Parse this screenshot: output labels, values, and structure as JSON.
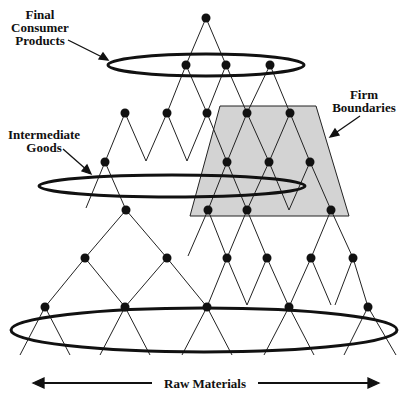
{
  "labels": {
    "final_l1": "Final",
    "final_l2": "Consumer",
    "final_l3": "Products",
    "firm_l1": "Firm",
    "firm_l2": "Boundaries",
    "inter_l1": "Intermediate",
    "inter_l2": "Goods",
    "raw": "Raw Materials"
  },
  "colors": {
    "node": "#111111",
    "line": "#222222",
    "firm_fill": "#d3d3d3"
  },
  "nodes": [
    [
      206,
      18
    ],
    [
      186,
      65
    ],
    [
      226,
      65
    ],
    [
      270,
      65
    ],
    [
      125,
      113
    ],
    [
      167,
      113
    ],
    [
      207,
      113
    ],
    [
      247,
      113
    ],
    [
      290,
      113
    ],
    [
      105,
      162
    ],
    [
      227,
      162
    ],
    [
      269,
      162
    ],
    [
      310,
      162
    ],
    [
      126,
      210
    ],
    [
      208,
      210
    ],
    [
      247,
      210
    ],
    [
      331,
      210
    ],
    [
      85,
      258
    ],
    [
      167,
      258
    ],
    [
      227,
      258
    ],
    [
      267,
      258
    ],
    [
      311,
      258
    ],
    [
      353,
      258
    ],
    [
      45,
      307
    ],
    [
      125,
      307
    ],
    [
      207,
      307
    ],
    [
      289,
      307
    ],
    [
      368,
      307
    ]
  ]
}
